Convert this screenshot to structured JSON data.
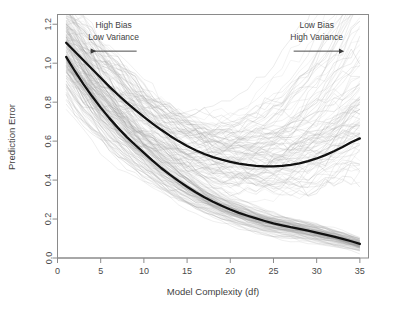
{
  "chart_data": {
    "type": "line",
    "title": "",
    "xlabel": "Model Complexity (df)",
    "ylabel": "Prediction Error",
    "xlim": [
      0,
      36
    ],
    "ylim": [
      0.0,
      1.25
    ],
    "xticks": [
      "0",
      "5",
      "10",
      "15",
      "20",
      "25",
      "30",
      "35"
    ],
    "xtick_values": [
      0,
      5,
      10,
      15,
      20,
      25,
      30,
      35
    ],
    "yticks": [
      "0.0",
      "0.2",
      "0.4",
      "0.6",
      "0.8",
      "1.0",
      "1.2"
    ],
    "ytick_values": [
      0.0,
      0.2,
      0.4,
      0.6,
      0.8,
      1.0,
      1.2
    ],
    "grid": false,
    "legend": "none",
    "x": [
      1,
      2,
      3,
      4,
      5,
      6,
      7,
      8,
      9,
      10,
      11,
      12,
      13,
      14,
      15,
      16,
      17,
      18,
      19,
      20,
      21,
      22,
      23,
      24,
      25,
      26,
      27,
      28,
      29,
      30,
      31,
      32,
      33,
      34,
      35
    ],
    "series": [
      {
        "name": "mean-test-error",
        "color": "#111111",
        "width": 2.3,
        "values": [
          1.105,
          1.06,
          1.015,
          0.97,
          0.925,
          0.88,
          0.838,
          0.798,
          0.76,
          0.724,
          0.69,
          0.658,
          0.628,
          0.6,
          0.575,
          0.553,
          0.534,
          0.518,
          0.505,
          0.494,
          0.485,
          0.478,
          0.473,
          0.47,
          0.47,
          0.473,
          0.478,
          0.486,
          0.497,
          0.511,
          0.528,
          0.548,
          0.57,
          0.594,
          0.614
        ]
      },
      {
        "name": "mean-training-error",
        "color": "#111111",
        "width": 2.3,
        "values": [
          1.032,
          0.96,
          0.893,
          0.83,
          0.772,
          0.718,
          0.668,
          0.622,
          0.58,
          0.54,
          0.5,
          0.462,
          0.428,
          0.396,
          0.366,
          0.338,
          0.312,
          0.289,
          0.268,
          0.249,
          0.232,
          0.217,
          0.203,
          0.19,
          0.178,
          0.168,
          0.158,
          0.149,
          0.14,
          0.13,
          0.12,
          0.11,
          0.098,
          0.086,
          0.072
        ]
      }
    ],
    "light_curves": {
      "count": 100,
      "color": "#9a9a9a",
      "opacity": 0.3,
      "description": "individual test-error curves (upper bundle) and training-error curves (lower bundle) for 100 simulated samples"
    },
    "annotations": [
      {
        "name": "high-bias-low-variance",
        "line1": "High Bias",
        "line2": "Low Variance",
        "arrow": "left",
        "x": 6.5,
        "y": 1.18
      },
      {
        "name": "low-bias-high-variance",
        "line1": "Low Bias",
        "line2": "High Variance",
        "arrow": "right",
        "x": 30.0,
        "y": 1.18
      }
    ]
  },
  "axes": {
    "frame_color": "#8a8a8a",
    "tick_color": "#8a8a8a"
  }
}
